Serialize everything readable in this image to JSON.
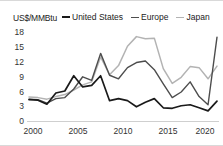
{
  "axis_unit": "US$/MMBtu",
  "legend": {
    "position": "top",
    "entries": [
      {
        "label": "United States",
        "color": "#1a1a1a",
        "name": "legend-united-states"
      },
      {
        "label": "Europe",
        "color": "#4d4d4d",
        "name": "legend-europe"
      },
      {
        "label": "Japan",
        "color": "#b3b3b3",
        "name": "legend-japan"
      }
    ]
  },
  "y_ticks": [
    "18",
    "15",
    "12",
    "9",
    "6",
    "3",
    "0"
  ],
  "x_ticks": [
    "2000",
    "2005",
    "2010",
    "2015",
    "2020"
  ],
  "chart_data": {
    "type": "line",
    "title": "",
    "subtitle": "",
    "xlabel": "",
    "ylabel": "US$/MMBtu",
    "ylim": [
      0,
      18
    ],
    "xlim": [
      2000,
      2021
    ],
    "grid": false,
    "legend_position": "top",
    "x": [
      2000,
      2001,
      2002,
      2003,
      2004,
      2005,
      2006,
      2007,
      2008,
      2009,
      2010,
      2011,
      2012,
      2013,
      2014,
      2015,
      2016,
      2017,
      2018,
      2019,
      2020,
      2021
    ],
    "series": [
      {
        "name": "United States",
        "color": "#1a1a1a",
        "values": [
          4.2,
          4.1,
          3.3,
          5.5,
          5.9,
          8.9,
          6.7,
          7.0,
          8.9,
          4.0,
          4.4,
          4.0,
          2.8,
          3.7,
          4.4,
          2.6,
          2.5,
          3.0,
          3.2,
          2.6,
          2.0,
          3.9
        ]
      },
      {
        "name": "Europe",
        "color": "#4d4d4d",
        "values": [
          4.3,
          4.2,
          3.5,
          4.4,
          4.6,
          6.3,
          8.7,
          8.0,
          13.3,
          9.0,
          8.3,
          10.5,
          11.5,
          11.8,
          10.1,
          7.3,
          4.6,
          5.7,
          7.7,
          4.8,
          3.2,
          16.5
        ]
      },
      {
        "name": "Japan",
        "color": "#b3b3b3",
        "values": [
          4.7,
          4.6,
          4.3,
          4.8,
          5.2,
          6.1,
          7.1,
          7.7,
          12.6,
          9.1,
          10.9,
          14.7,
          16.6,
          16.2,
          16.3,
          10.3,
          7.4,
          8.6,
          10.7,
          10.5,
          8.3,
          10.8
        ]
      }
    ]
  }
}
